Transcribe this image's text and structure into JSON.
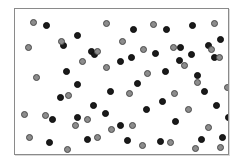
{
  "figure": {
    "frame": {
      "x": 14,
      "y": 8,
      "width": 215,
      "height": 147,
      "border_color": "#8a8a8a",
      "background_color": "#ffffff"
    },
    "legend": {
      "black_label": "black dot",
      "gray_label": "gray dot"
    }
  },
  "colors": {
    "black_fill": "#1a1a1a",
    "black_stroke": "#0d0d0d",
    "gray_fill": "#8c8c8c",
    "gray_stroke": "#4a4a4a",
    "frame_stroke": "#8a8a8a",
    "page_background": "#ffffff"
  },
  "chart_data": {
    "type": "scatter",
    "xlabel": "",
    "ylabel": "",
    "xlim": [
      0,
      215
    ],
    "ylim": [
      0,
      147
    ],
    "grid": false,
    "legend_position": "none",
    "annotations": [
      "Dots are arranged so that subsets of them trace two hidden curved glyph-like contours in the central region.",
      "Remaining dots form a random background field."
    ],
    "series": [
      {
        "name": "black dot",
        "color": "#1a1a1a",
        "marker": "circle",
        "marker_size": 7,
        "count": 41,
        "points": [
          [
            31,
            16
          ],
          [
            62,
            26
          ],
          [
            118,
            20
          ],
          [
            76,
            42
          ],
          [
            151,
            20
          ],
          [
            177,
            16
          ],
          [
            48,
            36
          ],
          [
            193,
            36
          ],
          [
            205,
            30
          ],
          [
            165,
            38
          ],
          [
            51,
            62
          ],
          [
            79,
            45
          ],
          [
            62,
            75
          ],
          [
            45,
            88
          ],
          [
            78,
            96
          ],
          [
            62,
            108
          ],
          [
            37,
            110
          ],
          [
            95,
            82
          ],
          [
            105,
            52
          ],
          [
            116,
            48
          ],
          [
            122,
            74
          ],
          [
            140,
            44
          ],
          [
            150,
            62
          ],
          [
            164,
            51
          ],
          [
            176,
            45
          ],
          [
            182,
            66
          ],
          [
            199,
            48
          ],
          [
            189,
            82
          ],
          [
            201,
            96
          ],
          [
            147,
            92
          ],
          [
            131,
            100
          ],
          [
            160,
            112
          ],
          [
            105,
            116
          ],
          [
            90,
            104
          ],
          [
            112,
            131
          ],
          [
            145,
            132
          ],
          [
            72,
            130
          ],
          [
            34,
            133
          ],
          [
            186,
            130
          ],
          [
            207,
            128
          ],
          [
            213,
            108
          ]
        ]
      },
      {
        "name": "gray dot",
        "color": "#8c8c8c",
        "marker": "circle",
        "marker_size": 7,
        "count": 37,
        "points": [
          [
            18,
            13
          ],
          [
            91,
            14
          ],
          [
            138,
            15
          ],
          [
            199,
            14
          ],
          [
            13,
            38
          ],
          [
            46,
            32
          ],
          [
            107,
            32
          ],
          [
            128,
            40
          ],
          [
            158,
            38
          ],
          [
            196,
            40
          ],
          [
            204,
            48
          ],
          [
            21,
            68
          ],
          [
            67,
            52
          ],
          [
            82,
            42
          ],
          [
            53,
            86
          ],
          [
            91,
            58
          ],
          [
            132,
            64
          ],
          [
            169,
            56
          ],
          [
            182,
            73
          ],
          [
            159,
            84
          ],
          [
            9,
            105
          ],
          [
            30,
            106
          ],
          [
            72,
            110
          ],
          [
            114,
            84
          ],
          [
            96,
            120
          ],
          [
            173,
            100
          ],
          [
            193,
            118
          ],
          [
            117,
            116
          ],
          [
            14,
            128
          ],
          [
            60,
            116
          ],
          [
            82,
            128
          ],
          [
            127,
            136
          ],
          [
            52,
            140
          ],
          [
            155,
            133
          ],
          [
            180,
            139
          ],
          [
            205,
            138
          ],
          [
            212,
            78
          ]
        ]
      }
    ]
  }
}
